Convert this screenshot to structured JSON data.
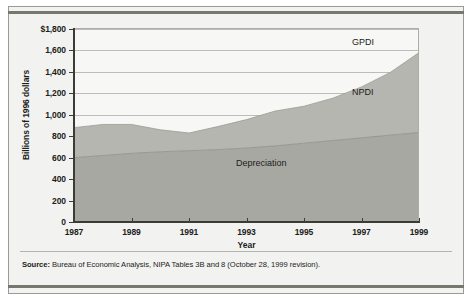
{
  "chart_data": {
    "type": "area",
    "title": "",
    "subtitle": "",
    "xlabel": "Year",
    "ylabel": "Billions of 1996 dollars",
    "xlim": [
      1987,
      1999
    ],
    "ylim": [
      0,
      1800
    ],
    "ytick_labels": [
      "$1,800",
      "1,600",
      "1,400",
      "1,200",
      "1,000",
      "800",
      "600",
      "400",
      "200",
      "0"
    ],
    "ytick_values": [
      1800,
      1600,
      1400,
      1200,
      1000,
      800,
      600,
      400,
      200,
      0
    ],
    "xtick_labels": [
      "1987",
      "1989",
      "1991",
      "1993",
      "1995",
      "1997",
      "1999"
    ],
    "xtick_values": [
      1987,
      1989,
      1991,
      1993,
      1995,
      1997,
      1999
    ],
    "grid": true,
    "legend_position": "inline-annotations",
    "stacked": true,
    "x": [
      1987,
      1988,
      1989,
      1990,
      1991,
      1992,
      1993,
      1994,
      1995,
      1996,
      1997,
      1998,
      1999
    ],
    "series": [
      {
        "name": "Depreciation",
        "label": "Depreciation",
        "color": "#a8a8a2",
        "values": [
          600,
          620,
          640,
          655,
          665,
          675,
          690,
          710,
          735,
          760,
          785,
          810,
          835
        ]
      },
      {
        "name": "NPDI",
        "label": "NPDI",
        "color": "#b6b6b0",
        "values": [
          280,
          290,
          270,
          205,
          165,
          215,
          265,
          325,
          345,
          395,
          475,
          585,
          745
        ]
      },
      {
        "name": "GPDI",
        "label": "GPDI",
        "color": "#f7f7f5",
        "values": [
          880,
          910,
          910,
          860,
          830,
          890,
          955,
          1035,
          1080,
          1155,
          1260,
          1395,
          1580
        ],
        "note": "GPDI is the total top boundary of the stacked area (Depreciation + NPDI)"
      }
    ],
    "annotations": [
      {
        "text": "GPDI",
        "x": 1997.2,
        "y": 1720
      },
      {
        "text": "NPDI",
        "x": 1997.2,
        "y": 1250
      },
      {
        "text": "Depreciation",
        "x": 1992.8,
        "y": 590
      }
    ]
  },
  "source": {
    "prefix": "Source:",
    "text": " Bureau of Economic Analysis, NIPA Tables 3B and 8 (October 28, 1999 revision)."
  }
}
